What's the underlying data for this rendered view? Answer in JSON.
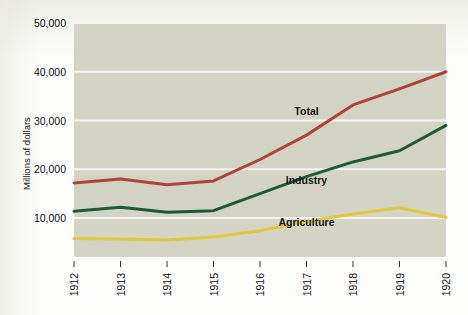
{
  "chart_data": {
    "type": "line",
    "title": "",
    "subtitle": "",
    "xlabel": "",
    "ylabel": "Millions of dollars",
    "x": [
      1912,
      1913,
      1914,
      1915,
      1916,
      1917,
      1918,
      1919,
      1920
    ],
    "categories": [
      "1912",
      "1913",
      "1914",
      "1915",
      "1916",
      "1917",
      "1918",
      "1919",
      "1920"
    ],
    "xlim": [
      1912,
      1920
    ],
    "ylim": [
      2000,
      50000
    ],
    "y_ticks": [
      10000,
      20000,
      30000,
      40000,
      50000
    ],
    "y_tick_labels": [
      "10,000",
      "20,000",
      "30,000",
      "40,000",
      "50,000"
    ],
    "grid": "horizontal-white",
    "legend_position": "inline-annotations",
    "plot_background": "#d3d4c3",
    "series": [
      {
        "name": "Total",
        "color": "#b0433c",
        "values": [
          17200,
          18000,
          16800,
          17600,
          22000,
          27000,
          33200,
          36500,
          40000
        ],
        "label_x": 1917,
        "label_y": 31200
      },
      {
        "name": "Industry",
        "color": "#1d5c33",
        "values": [
          11400,
          12200,
          11200,
          11500,
          15000,
          18500,
          21500,
          23800,
          29000
        ],
        "label_x": 1917,
        "label_y": 16900
      },
      {
        "name": "Agriculture",
        "color": "#e0c840",
        "values": [
          5800,
          5700,
          5500,
          6100,
          7400,
          9300,
          10800,
          12100,
          10100
        ],
        "label_x": 1917,
        "label_y": 8300
      }
    ]
  },
  "axes": {
    "y_axis_title": "Millions of dollars",
    "y_tick_labels": [
      "50,000",
      "40,000",
      "30,000",
      "20,000",
      "10,000"
    ],
    "x_tick_labels": [
      "1912",
      "1913",
      "1914",
      "1915",
      "1916",
      "1917",
      "1918",
      "1919",
      "1920"
    ]
  },
  "series_labels": {
    "total": "Total",
    "industry": "Industry",
    "agriculture": "Agriculture"
  },
  "colors": {
    "total": "#b0433c",
    "industry": "#1d5c33",
    "agriculture": "#e0c840",
    "plot_background": "#d3d4c3",
    "gridline": "#f4f4ef",
    "page_background": "#fdfdfc",
    "text": "#111111"
  }
}
